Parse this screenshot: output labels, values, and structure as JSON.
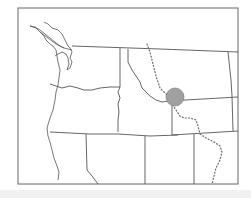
{
  "map": {
    "region": "Northwestern United States",
    "states_depicted": [
      "Washington",
      "Oregon",
      "Idaho",
      "Montana",
      "Wyoming",
      "Nevada",
      "Utah",
      "Colorado",
      "California",
      "North Dakota",
      "South Dakota"
    ],
    "features": {
      "continental_divide": {
        "style": "dotted",
        "color": "#666666"
      },
      "highlighted_area": {
        "shape": "circle",
        "color": "#a0a0a0",
        "center": [
          175,
          97
        ],
        "radius": 9
      }
    },
    "colors": {
      "background": "#ffffff",
      "boundary": "#555555",
      "frame": "#666666",
      "footer_bar": "#f1f1f1"
    },
    "labels": []
  }
}
